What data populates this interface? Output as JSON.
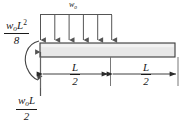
{
  "diagram": {
    "type": "beam-free-body-diagram",
    "beam": {
      "name": "beam",
      "fill_color": "#e8e8e8",
      "stroke_color": "#3a3a3a",
      "left_x": 40,
      "right_x": 175,
      "top_y": 43,
      "bottom_y": 57
    },
    "load": {
      "name": "distributed-load",
      "label": "w",
      "label_subscript": "o",
      "arrow_count": 6,
      "span_start_x": 40,
      "span_end_x": 112,
      "direction": "down",
      "color": "#555555"
    },
    "moment": {
      "name": "applied-moment",
      "numerator_w": "w",
      "numerator_sub": "o",
      "numerator_l": "L",
      "numerator_exp": "2",
      "denominator": "8",
      "direction": "counterclockwise",
      "color": "#444444"
    },
    "reaction": {
      "name": "vertical-reaction",
      "numerator_w": "w",
      "numerator_sub": "o",
      "numerator_l": "L",
      "denominator": "2",
      "direction": "up",
      "color": "#555555"
    },
    "dimensions": [
      {
        "name": "dimension-left-half",
        "numerator": "L",
        "denominator": "2",
        "start_x": 40,
        "end_x": 108
      },
      {
        "name": "dimension-right-half",
        "numerator": "L",
        "denominator": "2",
        "start_x": 112,
        "end_x": 178
      }
    ],
    "colors": {
      "line": "#3a3a3a",
      "beam_fill": "#e8e8e8",
      "text": "#1a1a1a",
      "background": "#ffffff"
    }
  }
}
